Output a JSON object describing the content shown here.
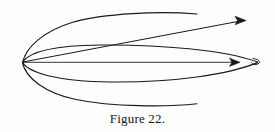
{
  "figure": {
    "caption": "Figure 22.",
    "background_color": "#fdfdfc",
    "ink_color": "#1a1a1c",
    "geometry": {
      "cusp_point": [
        22,
        62
      ],
      "lens_right_tip": [
        258,
        62
      ],
      "lens_top_apex": [
        132,
        45
      ],
      "lens_bottom_apex": [
        130,
        82
      ],
      "upper_arrow_tip": [
        246,
        20
      ],
      "middle_arrow_tip": [
        240,
        62
      ],
      "upper_tail_end": [
        197,
        14
      ],
      "lower_tail_end": [
        197,
        104
      ],
      "upper_crossing": [
        130,
        22
      ]
    },
    "strokes": [
      {
        "name": "outer-upper-arc",
        "kind": "curve",
        "path": "M 22.5 62.5 C 26 47 44 31 72 22.5 C 104 13 160 11 197 14"
      },
      {
        "name": "upper-straight-arrow-shaft",
        "kind": "line",
        "path": "M 23 62 L 243 20.5"
      },
      {
        "name": "upper-arrowhead",
        "kind": "arrowhead",
        "points": "246,20.5 235,16.2 237.5,20.5 235,24.8"
      },
      {
        "name": "lens-upper-boundary",
        "kind": "curve",
        "path": "M 22.5 62 C 30 51 55 45.5 100 45 C 160 44.4 225 50 257.5 62"
      },
      {
        "name": "middle-straight-arrow-shaft",
        "kind": "line",
        "path": "M 23 62.3 L 237 62.3"
      },
      {
        "name": "middle-arrowhead",
        "kind": "arrowhead",
        "points": "240,62.3 229.5,58.2 232,62.3 229.5,66.4"
      },
      {
        "name": "lens-lower-boundary",
        "kind": "curve",
        "path": "M 22.5 62.6 C 30 73 58 81.5 110 82 C 175 82.6 228 74.5 257.5 62.6"
      },
      {
        "name": "lens-right-cusp-loop",
        "kind": "curve",
        "path": "M 253 58.5 C 259.5 59.4 261 62 258 63.8 C 255.5 65.3 252.5 64.5 251.5 62.6"
      },
      {
        "name": "outer-lower-arc",
        "kind": "curve",
        "path": "M 22.5 63 C 26 78 45 93 76 99.5 C 112 107 168 107 197 103.8"
      }
    ]
  }
}
